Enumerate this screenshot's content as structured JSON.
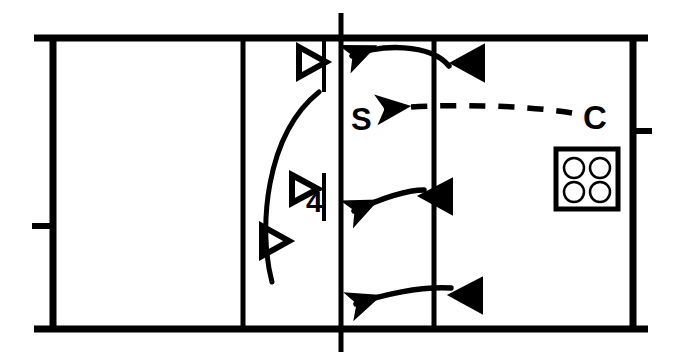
{
  "diagram": {
    "type": "volleyball-court-drill",
    "colors": {
      "line": "#000000",
      "background": "#ffffff",
      "fill_solid": "#000000",
      "fill_hollow": "#ffffff"
    },
    "court": {
      "left": 51,
      "top": 36,
      "right": 635,
      "bottom": 330,
      "border_width": 6,
      "top_overhang_left": 34,
      "top_overhang_right": 648,
      "bottom_overhang_left": 34,
      "bottom_overhang_right": 648
    },
    "lines": [
      {
        "name": "left-attack-line",
        "x": 242,
        "label": ""
      },
      {
        "name": "center-net-line",
        "x": 340,
        "label": ""
      },
      {
        "name": "right-attack-line",
        "x": 434,
        "label": ""
      }
    ],
    "post_ticks": [
      {
        "name": "left-post-tick",
        "x": 34,
        "y": 225
      },
      {
        "name": "right-post-tick",
        "x": 648,
        "y": 130
      }
    ],
    "net_antenna": {
      "name": "net-antenna",
      "x": 323,
      "y_top": 40,
      "y_bottom": 92
    },
    "net_antenna_lower": {
      "name": "net-antenna-lower",
      "x": 323,
      "y_top": 172,
      "y_bottom": 220
    },
    "labels": [
      {
        "name": "setter-label",
        "text": "S",
        "x": 352,
        "y": 128
      },
      {
        "name": "coach-label",
        "text": "C",
        "x": 586,
        "y": 127
      },
      {
        "name": "player-number-label",
        "text": "4",
        "x": 313,
        "y": 206
      }
    ],
    "hollow_players": [
      {
        "name": "hollow-player-front",
        "x": 298,
        "y": 62,
        "direction": "right"
      },
      {
        "name": "hollow-player-middle",
        "x": 293,
        "y": 188,
        "direction": "right"
      },
      {
        "name": "hollow-player-back",
        "x": 262,
        "y": 240,
        "direction": "right"
      }
    ],
    "solid_players": [
      {
        "name": "solid-player-front",
        "x": 466,
        "y": 63,
        "direction": "left"
      },
      {
        "name": "solid-player-middle",
        "x": 430,
        "y": 196,
        "direction": "left"
      },
      {
        "name": "solid-player-back",
        "x": 462,
        "y": 295,
        "direction": "left"
      }
    ],
    "ball_cart": {
      "name": "ball-cart",
      "x": 556,
      "y": 149,
      "width": 62,
      "height": 60,
      "ball_count": 4
    },
    "arrows": [
      {
        "name": "arrow-front-attack",
        "style": "solid",
        "from": {
          "x": 450,
          "y": 60
        },
        "to": {
          "x": 345,
          "y": 57
        }
      },
      {
        "name": "arrow-coach-to-setter",
        "style": "dashed",
        "from": {
          "x": 572,
          "y": 113
        },
        "to": {
          "x": 378,
          "y": 108
        }
      },
      {
        "name": "arrow-middle-attack",
        "style": "solid",
        "from": {
          "x": 424,
          "y": 190
        },
        "to": {
          "x": 345,
          "y": 212
        }
      },
      {
        "name": "arrow-back-attack",
        "style": "solid",
        "from": {
          "x": 451,
          "y": 288
        },
        "to": {
          "x": 348,
          "y": 305
        }
      },
      {
        "name": "arrow-player-transition",
        "style": "solid-curve",
        "from": {
          "x": 261,
          "y": 228
        },
        "to": {
          "x": 318,
          "y": 90
        }
      }
    ]
  }
}
